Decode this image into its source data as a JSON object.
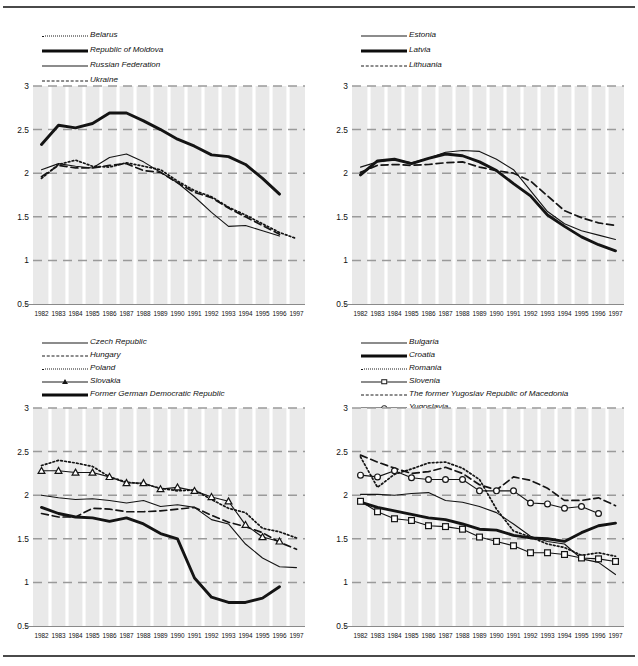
{
  "figure": {
    "panels": [
      {
        "id": "panel-eastern-europe",
        "legend": [
          {
            "name": "Belarus",
            "style": "dot"
          },
          {
            "name": "Republic of Moldova",
            "style": "thick"
          },
          {
            "name": "Russian Federation",
            "style": "thin"
          },
          {
            "name": "Ukraine",
            "style": "dash"
          }
        ]
      },
      {
        "id": "panel-baltic-states",
        "legend": [
          {
            "name": "Estonia",
            "style": "thin"
          },
          {
            "name": "Latvia",
            "style": "thick"
          },
          {
            "name": "Lithuania",
            "style": "dash"
          }
        ]
      },
      {
        "id": "panel-central-europe",
        "legend": [
          {
            "name": "Czech Republic",
            "style": "thin"
          },
          {
            "name": "Hungary",
            "style": "dash"
          },
          {
            "name": "Poland",
            "style": "dot"
          },
          {
            "name": "Slovakia",
            "style": "mark-triangle"
          },
          {
            "name": "Former German Democratic Republic",
            "style": "thick"
          }
        ]
      },
      {
        "id": "panel-south-eastern-europe",
        "legend": [
          {
            "name": "Bulgaria",
            "style": "thin"
          },
          {
            "name": "Croatia",
            "style": "thick"
          },
          {
            "name": "Romania",
            "style": "dot"
          },
          {
            "name": "Slovenia",
            "style": "mark-square"
          },
          {
            "name": "The former Yugoslav Republic of Macedonia",
            "style": "dash"
          },
          {
            "name": "Yugoslavia",
            "style": "mark-circle"
          }
        ]
      }
    ]
  },
  "axes": {
    "x_ticks": [
      "1982",
      "1983",
      "1984",
      "1985",
      "1986",
      "1987",
      "1988",
      "1989",
      "1990",
      "1991",
      "1992",
      "1993",
      "1994",
      "1995",
      "1996",
      "1997"
    ],
    "y_ticks": [
      "3",
      "2.5",
      "2",
      "1.5",
      "1",
      "0.5"
    ],
    "ylim": [
      0.5,
      3.0
    ],
    "xlim": [
      1982,
      1997
    ]
  },
  "colors": {
    "plot_background": "#e9e9e9",
    "gridline_horizontal": "#9a9a9a",
    "gridline_vertical": "#ffffff",
    "line": "#141414",
    "rule": "#4a4a4a"
  },
  "chart_data": [
    {
      "type": "line",
      "title": "",
      "xlabel": "",
      "ylabel": "",
      "xlim": [
        1982,
        1997
      ],
      "ylim": [
        0.5,
        3.0
      ],
      "grid": true,
      "legend_position": "above-plot",
      "x": [
        1982,
        1983,
        1984,
        1985,
        1986,
        1987,
        1988,
        1989,
        1990,
        1991,
        1992,
        1993,
        1994,
        1995,
        1996,
        1997
      ],
      "series": [
        {
          "name": "Belarus",
          "style": "dotted",
          "values": [
            1.94,
            2.1,
            2.15,
            2.08,
            2.07,
            2.12,
            2.08,
            2.04,
            1.91,
            1.8,
            1.73,
            1.61,
            1.52,
            1.42,
            1.32,
            1.25
          ]
        },
        {
          "name": "Republic of Moldova",
          "style": "thick-solid",
          "values": [
            2.33,
            2.55,
            2.52,
            2.57,
            2.69,
            2.69,
            2.6,
            2.5,
            2.39,
            2.31,
            2.21,
            2.19,
            2.1,
            1.94,
            1.76,
            null
          ]
        },
        {
          "name": "Russian Federation",
          "style": "thin-solid",
          "values": [
            2.04,
            2.11,
            2.08,
            2.06,
            2.18,
            2.22,
            2.13,
            2.01,
            1.89,
            1.73,
            1.55,
            1.39,
            1.4,
            1.34,
            1.28,
            null
          ]
        },
        {
          "name": "Ukraine",
          "style": "dashed",
          "values": [
            1.96,
            2.09,
            2.06,
            2.06,
            2.09,
            2.11,
            2.03,
            2.01,
            1.89,
            1.78,
            1.72,
            1.6,
            1.5,
            1.4,
            1.3,
            null
          ]
        }
      ]
    },
    {
      "type": "line",
      "title": "",
      "xlabel": "",
      "ylabel": "",
      "xlim": [
        1982,
        1997
      ],
      "ylim": [
        0.5,
        3.0
      ],
      "grid": true,
      "legend_position": "above-plot",
      "x": [
        1982,
        1983,
        1984,
        1985,
        1986,
        1987,
        1988,
        1989,
        1990,
        1991,
        1992,
        1993,
        1994,
        1995,
        1996,
        1997
      ],
      "series": [
        {
          "name": "Estonia",
          "style": "thin-solid",
          "values": [
            2.07,
            2.13,
            2.16,
            2.12,
            2.17,
            2.24,
            2.26,
            2.25,
            2.16,
            2.04,
            1.8,
            1.56,
            1.42,
            1.34,
            1.29,
            1.24
          ]
        },
        {
          "name": "Latvia",
          "style": "thick-solid",
          "values": [
            1.98,
            2.14,
            2.16,
            2.11,
            2.17,
            2.22,
            2.2,
            2.13,
            2.03,
            1.88,
            1.74,
            1.52,
            1.39,
            1.27,
            1.18,
            1.11
          ]
        },
        {
          "name": "Lithuania",
          "style": "dashed",
          "values": [
            2.01,
            2.09,
            2.1,
            2.09,
            2.1,
            2.12,
            2.13,
            2.07,
            2.03,
            2.0,
            1.91,
            1.74,
            1.57,
            1.49,
            1.43,
            1.4
          ]
        }
      ]
    },
    {
      "type": "line",
      "title": "",
      "xlabel": "",
      "ylabel": "",
      "xlim": [
        1982,
        1997
      ],
      "ylim": [
        0.5,
        3.0
      ],
      "grid": true,
      "legend_position": "above-plot",
      "x": [
        1982,
        1983,
        1984,
        1985,
        1986,
        1987,
        1988,
        1989,
        1990,
        1991,
        1992,
        1993,
        1994,
        1995,
        1996,
        1997
      ],
      "series": [
        {
          "name": "Czech Republic",
          "style": "thin-solid",
          "values": [
            2.0,
            1.97,
            1.95,
            1.96,
            1.94,
            1.91,
            1.94,
            1.87,
            1.89,
            1.86,
            1.72,
            1.67,
            1.44,
            1.28,
            1.18,
            1.17
          ]
        },
        {
          "name": "Hungary",
          "style": "dashed",
          "values": [
            1.79,
            1.75,
            1.75,
            1.85,
            1.84,
            1.81,
            1.81,
            1.82,
            1.84,
            1.86,
            1.77,
            1.69,
            1.64,
            1.57,
            1.46,
            1.38
          ]
        },
        {
          "name": "Poland",
          "style": "dotted",
          "values": [
            2.34,
            2.4,
            2.37,
            2.33,
            2.21,
            2.15,
            2.13,
            2.08,
            2.05,
            2.06,
            1.95,
            1.85,
            1.8,
            1.62,
            1.58,
            1.51
          ]
        },
        {
          "name": "Slovakia",
          "style": "marker-triangle",
          "values": [
            2.28,
            2.28,
            2.26,
            2.26,
            2.21,
            2.14,
            2.14,
            2.07,
            2.09,
            2.05,
            1.98,
            1.93,
            1.66,
            1.52,
            1.47,
            null
          ]
        },
        {
          "name": "Former German Democratic Republic",
          "style": "thick-solid",
          "values": [
            1.86,
            1.79,
            1.75,
            1.74,
            1.7,
            1.74,
            1.67,
            1.56,
            1.5,
            1.05,
            0.83,
            0.77,
            0.77,
            0.82,
            0.95,
            null
          ]
        }
      ]
    },
    {
      "type": "line",
      "title": "",
      "xlabel": "",
      "ylabel": "",
      "xlim": [
        1982,
        1997
      ],
      "ylim": [
        0.5,
        3.0
      ],
      "grid": true,
      "legend_position": "above-plot",
      "x": [
        1982,
        1983,
        1984,
        1985,
        1986,
        1987,
        1988,
        1989,
        1990,
        1991,
        1992,
        1993,
        1994,
        1995,
        1996,
        1997
      ],
      "series": [
        {
          "name": "Bulgaria",
          "style": "thin-solid",
          "values": [
            2.01,
            2.01,
            2.0,
            2.02,
            2.03,
            1.94,
            1.92,
            1.87,
            1.8,
            1.67,
            1.53,
            1.47,
            1.44,
            1.27,
            1.23,
            1.09
          ]
        },
        {
          "name": "Croatia",
          "style": "thick-solid",
          "values": [
            1.92,
            1.86,
            1.82,
            1.78,
            1.74,
            1.72,
            1.67,
            1.61,
            1.6,
            1.54,
            1.51,
            1.5,
            1.47,
            1.57,
            1.65,
            1.68
          ]
        },
        {
          "name": "Romania",
          "style": "dotted",
          "values": [
            2.44,
            2.09,
            2.24,
            2.3,
            2.37,
            2.38,
            2.31,
            2.18,
            1.84,
            1.59,
            1.52,
            1.44,
            1.4,
            1.31,
            1.34,
            1.3
          ]
        },
        {
          "name": "Slovenia",
          "style": "marker-square",
          "values": [
            1.93,
            1.81,
            1.73,
            1.71,
            1.65,
            1.64,
            1.61,
            1.52,
            1.47,
            1.42,
            1.34,
            1.34,
            1.32,
            1.28,
            1.27,
            1.24
          ]
        },
        {
          "name": "The former Yugoslav Republic of Macedonia",
          "style": "dashed",
          "values": [
            2.46,
            2.38,
            2.31,
            2.25,
            2.27,
            2.32,
            2.25,
            2.12,
            2.06,
            2.21,
            2.17,
            2.08,
            1.94,
            1.94,
            1.97,
            1.88
          ]
        },
        {
          "name": "Yugoslavia",
          "style": "marker-circle",
          "values": [
            2.23,
            2.21,
            2.28,
            2.2,
            2.18,
            2.18,
            2.18,
            2.05,
            2.05,
            2.05,
            1.91,
            1.9,
            1.85,
            1.87,
            1.79,
            null
          ]
        }
      ]
    }
  ]
}
